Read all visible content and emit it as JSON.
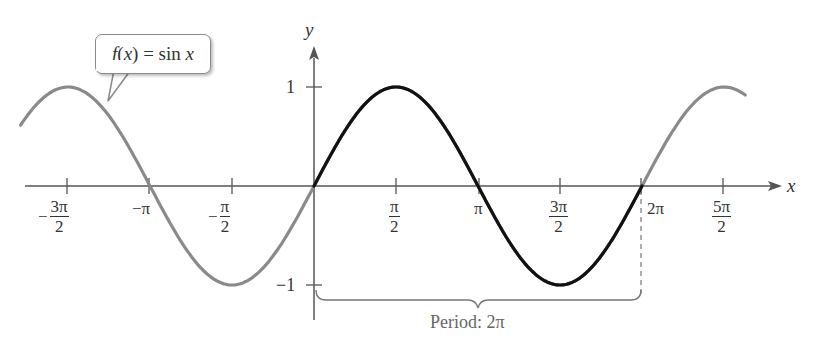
{
  "chart_data": {
    "type": "line",
    "title": "",
    "function": "f(x) = sin x",
    "xlabel": "x",
    "ylabel": "y",
    "x_ticks": [
      "-3π/2",
      "-π",
      "-π/2",
      "π/2",
      "π",
      "3π/2",
      "2π",
      "5π/2"
    ],
    "x_tick_values": [
      -4.712,
      -3.142,
      -1.571,
      1.571,
      3.142,
      4.712,
      6.283,
      7.854
    ],
    "y_ticks": [
      "1",
      "-1"
    ],
    "y_tick_values": [
      1,
      -1
    ],
    "xlim": [
      -5.4,
      8.4
    ],
    "ylim": [
      -1.3,
      1.6
    ],
    "series": [
      {
        "name": "sin x (extended)",
        "color": "#8a8a8a",
        "x_range": [
          -5.4,
          8.3
        ],
        "style": "gray"
      },
      {
        "name": "sin x (one period)",
        "color": "#111111",
        "x_range": [
          0,
          6.283
        ],
        "style": "bold black"
      }
    ],
    "key_points": [
      {
        "x": "0",
        "y": 0
      },
      {
        "x": "π/2",
        "y": 1
      },
      {
        "x": "π",
        "y": 0
      },
      {
        "x": "3π/2",
        "y": -1
      },
      {
        "x": "2π",
        "y": 0
      }
    ],
    "annotations": [
      "f(x) = sin x",
      "Period: 2π"
    ],
    "grid": false,
    "legend": "none"
  },
  "labels": {
    "callout": "f(x) = sin x",
    "callout_f": "f",
    "callout_x": "(x)",
    "callout_eq": " = sin ",
    "callout_var": "x",
    "period": "Period: 2π",
    "x_axis": "x",
    "y_axis": "y",
    "y_one": "1",
    "y_neg_one": "−1",
    "neg_pi": "−π",
    "pi": "π",
    "two_pi": "2π",
    "minus": "−",
    "pi_num": "π",
    "three_pi_num": "3π",
    "five_pi_num": "5π",
    "den_two": "2"
  },
  "colors": {
    "gray_curve": "#8a8a8a",
    "black_curve": "#111111",
    "axis": "#555555"
  }
}
